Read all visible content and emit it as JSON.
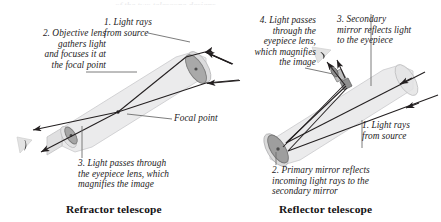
{
  "figure": {
    "background_color": "#ffffff",
    "ink_color": "#231f20",
    "tube_fill": "#e9e9ea",
    "lens_fill": "#a8a8a8",
    "mirror_fill": "#9d9d9d",
    "image_triangle_fill": "#e2e2e2",
    "top_cut_text": "of the two telescope designs"
  },
  "refractor": {
    "caption": "Refractor telescope",
    "labels": {
      "objective": "2. Objective lens\ngathers light\nand focuses it at\nthe focal point",
      "light_rays": "1. Light rays\nfrom source",
      "focal_point": "Focal point",
      "eyepiece": "3. Light passes through\nthe eyepiece lens, which\nmagnifies the image"
    }
  },
  "reflector": {
    "caption": "Reflector telescope",
    "labels": {
      "eyepiece": "4. Light passes\nthrough the\neyepiece lens,\nwhich magnifies\nthe image",
      "secondary_mirror": "3. Secondary\nmirror reflects light\nto the eyepiece",
      "light_rays": "1. Light rays\nfrom source",
      "primary_mirror": "2. Primary mirror reflects\nincoming light rays to the\nsecondary mirror"
    }
  }
}
